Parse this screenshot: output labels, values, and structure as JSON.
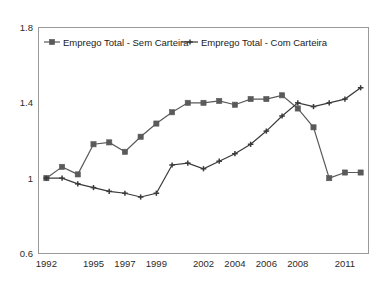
{
  "chart_data": {
    "type": "line",
    "title": "",
    "subtitle": "",
    "xlabel": "",
    "ylabel": "",
    "xlim": [
      1991.5,
      2012.5
    ],
    "ylim": [
      0.6,
      1.8
    ],
    "grid": false,
    "legend_position": "top-inside",
    "y_ticks": [
      "1.8",
      "1.4",
      "1",
      "0.6"
    ],
    "y_tick_values": [
      1.8,
      1.4,
      1.0,
      0.6
    ],
    "x_ticks": [
      "1992",
      "1995",
      "1997",
      "1999",
      "2002",
      "2004",
      "2006",
      "2008",
      "2011"
    ],
    "x_tick_values": [
      1992,
      1995,
      1997,
      1999,
      2002,
      2004,
      2006,
      2008,
      2011
    ],
    "x": [
      1992,
      1993,
      1994,
      1995,
      1996,
      1997,
      1998,
      1999,
      2000,
      2001,
      2002,
      2003,
      2004,
      2005,
      2006,
      2007,
      2008,
      2009,
      2010,
      2011,
      2012
    ],
    "series": [
      {
        "name": "Emprego Total - Sem Carteira",
        "marker": "square",
        "color": "#5a5a5a",
        "values": [
          1.0,
          1.06,
          1.02,
          1.18,
          1.19,
          1.14,
          1.22,
          1.29,
          1.35,
          1.4,
          1.4,
          1.41,
          1.39,
          1.42,
          1.42,
          1.44,
          1.37,
          1.27,
          1.0,
          1.03,
          1.03
        ]
      },
      {
        "name": "Emprego Total - Com Carteira",
        "marker": "cross",
        "color": "#3a3a3a",
        "values": [
          1.0,
          1.0,
          0.97,
          0.95,
          0.93,
          0.92,
          0.9,
          0.92,
          1.07,
          1.08,
          1.05,
          1.09,
          1.13,
          1.18,
          1.25,
          1.33,
          1.4,
          1.38,
          1.4,
          1.42,
          1.48
        ]
      }
    ],
    "legend": [
      {
        "label": "Emprego Total - Sem Carteira",
        "marker": "square",
        "color": "#5a5a5a"
      },
      {
        "label": "Emprego Total - Com Carteira",
        "marker": "cross",
        "color": "#3a3a3a"
      }
    ]
  }
}
